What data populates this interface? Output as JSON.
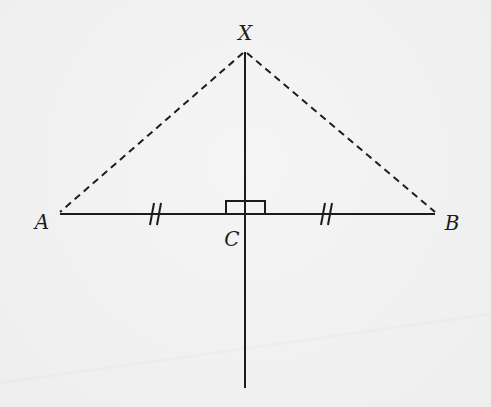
{
  "diagram": {
    "colors": {
      "background": "#f1f1f1",
      "ink": "#1c1c1c"
    },
    "points": {
      "A": {
        "label": "A",
        "x": 60,
        "y": 214
      },
      "B": {
        "label": "B",
        "x": 435,
        "y": 214
      },
      "C": {
        "label": "C",
        "x": 245,
        "y": 214
      },
      "X": {
        "label": "X",
        "x": 245,
        "y": 52
      }
    },
    "segments": [
      {
        "name": "AB",
        "style": "solid"
      },
      {
        "name": "perpendicular-line",
        "style": "solid",
        "from_y": 52,
        "to_y": 388
      },
      {
        "name": "XA",
        "style": "dashed"
      },
      {
        "name": "XB",
        "style": "dashed"
      }
    ],
    "markers": {
      "right_angle_at": "C",
      "equal_ticks": [
        "AC",
        "CB"
      ],
      "tick_count": 2
    },
    "labels": {
      "A": "A",
      "B": "B",
      "C": "C",
      "X": "X"
    }
  }
}
